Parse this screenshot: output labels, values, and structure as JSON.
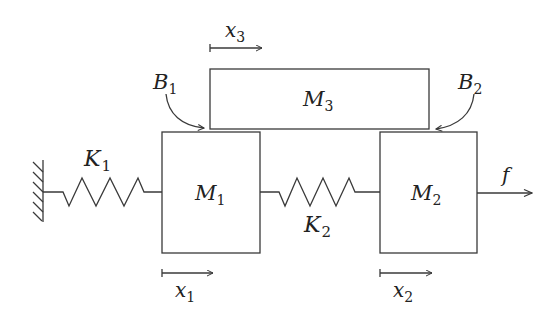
{
  "diagram": {
    "type": "mechanical-mass-spring-damper",
    "colors": {
      "stroke": "#3a3a3a",
      "text": "#222222",
      "background": "#ffffff"
    },
    "masses": [
      {
        "id": "M1",
        "label": "M",
        "sub": "1"
      },
      {
        "id": "M2",
        "label": "M",
        "sub": "2"
      },
      {
        "id": "M3",
        "label": "M",
        "sub": "3"
      }
    ],
    "springs": [
      {
        "id": "K1",
        "label": "K",
        "sub": "1",
        "connects": [
          "wall",
          "M1"
        ]
      },
      {
        "id": "K2",
        "label": "K",
        "sub": "2",
        "connects": [
          "M1",
          "M2"
        ]
      }
    ],
    "dampers": [
      {
        "id": "B1",
        "label": "B",
        "sub": "1",
        "between": [
          "M1",
          "M3"
        ]
      },
      {
        "id": "B2",
        "label": "B",
        "sub": "2",
        "between": [
          "M2",
          "M3"
        ]
      }
    ],
    "displacements": [
      {
        "id": "x1",
        "label": "x",
        "sub": "1",
        "mass": "M1"
      },
      {
        "id": "x2",
        "label": "x",
        "sub": "2",
        "mass": "M2"
      },
      {
        "id": "x3",
        "label": "x",
        "sub": "3",
        "mass": "M3"
      }
    ],
    "force": {
      "id": "f",
      "label": "f",
      "applied_to": "M2"
    },
    "wall": {
      "label": "fixed-wall"
    }
  }
}
